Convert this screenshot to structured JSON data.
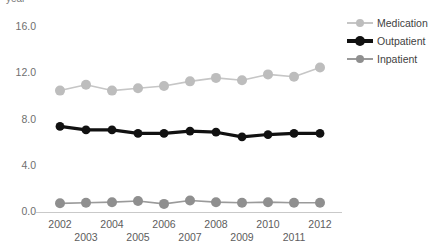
{
  "chart_data": {
    "type": "line",
    "title": "",
    "xlabel": "",
    "ylabel": "year",
    "ylim": [
      0,
      17
    ],
    "xlim": [
      2002,
      2012
    ],
    "grid": false,
    "legend_position": "right",
    "yticks": [
      "0.0",
      "4.0",
      "8.0",
      "12.0",
      "16.0"
    ],
    "ytick_values": [
      0.0,
      4.0,
      8.0,
      12.0,
      16.0
    ],
    "categories": [
      2002,
      2003,
      2004,
      2005,
      2006,
      2007,
      2008,
      2009,
      2010,
      2011,
      2012
    ],
    "xtick_labels": [
      "2002",
      "2003",
      "2004",
      "2005",
      "2006",
      "2007",
      "2008",
      "2009",
      "2010",
      "2011",
      "2012"
    ],
    "series": [
      {
        "name": "Medication",
        "color": "#c6c6c6",
        "marker_color": "#bdbdbd",
        "line_width": 1.6,
        "marker_size": 5.0,
        "values": [
          10.5,
          11.0,
          10.5,
          10.7,
          10.9,
          11.3,
          11.6,
          11.4,
          11.9,
          11.7,
          12.5
        ]
      },
      {
        "name": "Outpatient",
        "color": "#111111",
        "marker_color": "#111111",
        "line_width": 3.2,
        "marker_size": 4.4,
        "values": [
          7.4,
          7.1,
          7.1,
          6.8,
          6.8,
          7.0,
          6.9,
          6.5,
          6.7,
          6.8,
          6.8
        ]
      },
      {
        "name": "Inpatient",
        "color": "#9a9a9a",
        "marker_color": "#8f8f8f",
        "line_width": 1.6,
        "marker_size": 5.0,
        "values": [
          0.75,
          0.8,
          0.85,
          0.95,
          0.7,
          1.0,
          0.85,
          0.8,
          0.85,
          0.8,
          0.8
        ]
      }
    ]
  },
  "legend": {
    "items": [
      {
        "label": "Medication"
      },
      {
        "label": "Outpatient"
      },
      {
        "label": "Inpatient"
      }
    ]
  }
}
